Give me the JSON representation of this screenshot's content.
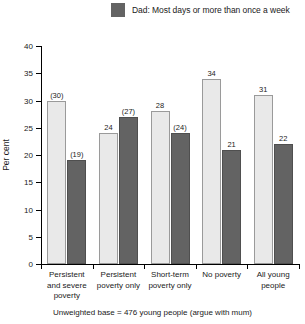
{
  "legend": {
    "items": [
      {
        "label": "Dad: Most days or more than once a week",
        "color": "#636363",
        "name": "dad-series"
      }
    ]
  },
  "axis": {
    "ylabel": "Per cent",
    "yticks": [
      "0",
      "5",
      "10",
      "15",
      "20",
      "25",
      "30",
      "35",
      "40"
    ]
  },
  "footnote": "Unweighted base = 476 young people (argue with mum)",
  "chart_data": {
    "type": "bar",
    "title": "",
    "xlabel": "",
    "ylabel": "Per cent",
    "ylim": [
      0,
      40
    ],
    "ytick_step": 5,
    "grid": false,
    "legend_position": "top",
    "categories": [
      "Persistent\nand severe\npoverty",
      "Persistent\npoverty only",
      "Short-term\npoverty only",
      "No poverty",
      "All young\npeople"
    ],
    "series": [
      {
        "name": "Mum",
        "color": "#e9e9e9",
        "values": [
          30,
          24,
          28,
          34,
          31
        ],
        "labels": [
          "(30)",
          "24",
          "28",
          "34",
          "31"
        ]
      },
      {
        "name": "Dad: Most days or more than once a week",
        "color": "#636363",
        "values": [
          19,
          27,
          24,
          21,
          22
        ],
        "labels": [
          "(19)",
          "(27)",
          "(24)",
          "21",
          "22"
        ]
      }
    ]
  }
}
